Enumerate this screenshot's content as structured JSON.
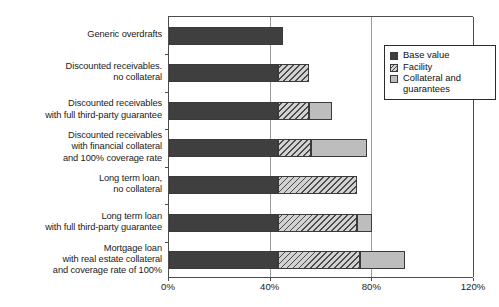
{
  "chart_data": {
    "type": "bar",
    "orientation": "horizontal",
    "stacked": true,
    "title": "",
    "xlabel": "",
    "ylabel": "",
    "xlim": [
      0,
      120
    ],
    "xticks": [
      "0%",
      "40%",
      "80%",
      "120%"
    ],
    "xtick_values": [
      0,
      40,
      80,
      120
    ],
    "grid": true,
    "grid_axis": "x",
    "legend_position": "top-right",
    "categories": [
      "Generic overdrafts",
      "Discounted receivables. no collateral",
      "Discounted receivables with full third-party guarantee",
      "Discounted receivables with financial collateral and 100% coverage rate",
      "Long term loan, no collateral",
      "Long term loan with full third-party guarantee",
      "Mortgage loan with real estate collateral and coverage rate of 100%"
    ],
    "category_lines": [
      [
        "Generic overdrafts"
      ],
      [
        "Discounted receivables.",
        "no collateral"
      ],
      [
        "Discounted receivables",
        "with full third-party guarantee"
      ],
      [
        "Discounted receivables",
        "with financial collateral",
        "and 100% coverage rate"
      ],
      [
        "Long term loan,",
        "no collateral"
      ],
      [
        "Long term loan",
        "with full third-party guarantee"
      ],
      [
        "Mortgage loan",
        "with real estate collateral",
        "and coverage rate of 100%"
      ]
    ],
    "series": [
      {
        "name": "Base value",
        "color": "#3f3f3f",
        "values": [
          45,
          43,
          43,
          43,
          43,
          43,
          43
        ]
      },
      {
        "name": "Facility",
        "color": "#d2d2d2",
        "pattern": "diagonal-hatch",
        "values": [
          0,
          12,
          12,
          13,
          31,
          31,
          32
        ]
      },
      {
        "name": "Collateral and guarantees",
        "color": "#bdbdbd",
        "values": [
          0,
          0,
          9,
          22,
          0,
          6,
          18
        ]
      }
    ],
    "totals": [
      45,
      55,
      64,
      78,
      74,
      80,
      93
    ]
  },
  "legend": {
    "items": [
      {
        "label": "Base value",
        "label_line2": "",
        "swatch": "base"
      },
      {
        "label": "Facility",
        "label_line2": "",
        "swatch": "facility"
      },
      {
        "label": "Collateral and",
        "label_line2": "guarantees",
        "swatch": "collateral"
      }
    ]
  },
  "caption": {
    "text": ""
  },
  "colors": {
    "base_value": "#3f3f3f",
    "facility": "#d2d2d2",
    "collateral": "#bdbdbd",
    "axis": "#4d4d4d",
    "grid": "#9a9a9a"
  }
}
